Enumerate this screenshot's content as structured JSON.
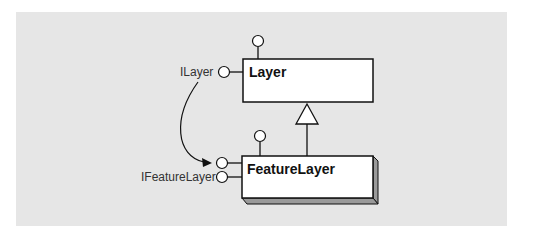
{
  "diagram": {
    "type": "UML class diagram",
    "classes": [
      {
        "name": "Layer",
        "style": "abstract-flat"
      },
      {
        "name": "FeatureLayer",
        "style": "concrete-3d"
      }
    ],
    "interfaces": [
      {
        "label": "ILayer",
        "attached_to": "Layer"
      },
      {
        "label": "IFeatureLayer",
        "attached_to": "FeatureLayer"
      }
    ],
    "relationships": [
      {
        "type": "inheritance",
        "from": "FeatureLayer",
        "to": "Layer"
      },
      {
        "type": "interface-inheritance-arrow",
        "from": "ILayer",
        "to": "FeatureLayer"
      }
    ]
  },
  "labels": {
    "layer_class": "Layer",
    "feature_layer_class": "FeatureLayer",
    "ilayer_interface": "ILayer",
    "ifeaturelayer_interface": "IFeatureLayer"
  },
  "colors": {
    "background": "#e6e6e6",
    "box_fill": "#ffffff",
    "stroke": "#111111",
    "shadow": "#9a9a9a"
  }
}
